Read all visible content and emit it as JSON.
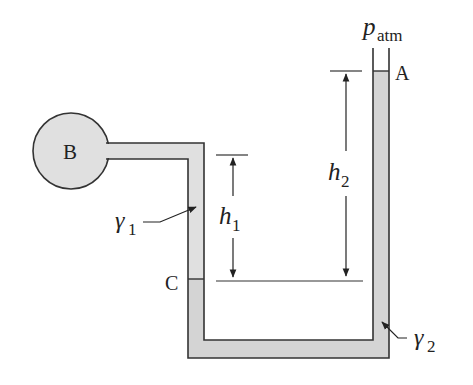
{
  "diagram": {
    "type": "manometer",
    "labels": {
      "bulb": "B",
      "point_a": "A",
      "point_c": "C",
      "p_atm_main": "p",
      "p_atm_sub": "atm",
      "h1_main": "h",
      "h1_sub": "1",
      "h2_main": "h",
      "h2_sub": "2",
      "gamma1_main": "γ",
      "gamma1_sub": "1",
      "gamma2_main": "γ",
      "gamma2_sub": "2"
    },
    "colors": {
      "fluid_fill": "#d4d4d4",
      "outline": "#333333",
      "background": "#ffffff"
    }
  }
}
